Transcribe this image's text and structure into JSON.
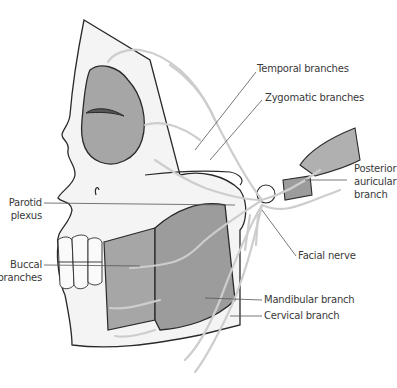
{
  "figure": {
    "labels": {
      "temporal": "Temporal branches",
      "zygomatic": "Zygomatic branches",
      "posterior_line1": "Posterior",
      "posterior_line2": "auricular",
      "posterior_line3": "branch",
      "parotid_line1": "Parotid",
      "parotid_line2": "plexus",
      "buccal_line1": "Buccal",
      "buccal_line2": "branches",
      "facial_nerve": "Facial nerve",
      "mandibular": "Mandibular branch",
      "cervical": "Cervical branch"
    },
    "colors": {
      "outline": "#2a2a2a",
      "fill_gray": "#a6a6a6",
      "fill_light": "#f2f2f2",
      "nerve": "#cfcfcf",
      "leader": "#555555",
      "text": "#3a3a3a"
    }
  }
}
